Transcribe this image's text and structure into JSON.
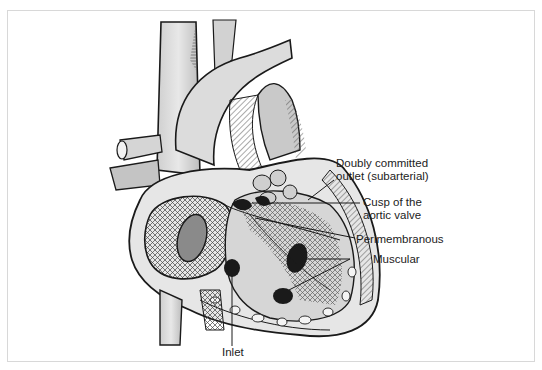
{
  "figure": {
    "colors": {
      "ink": "#1a1a1a",
      "shade_light": "#e4e4e4",
      "shade_mid": "#bdbdbd",
      "shade_dark": "#6a6a6a",
      "frame": "#d8d8d8"
    },
    "labels": [
      {
        "id": "doubly-committed",
        "line1": "Doubly committed",
        "line2": "outlet (subarterial)"
      },
      {
        "id": "cusp",
        "line1": "Cusp of the",
        "line2": "aortic valve"
      },
      {
        "id": "perimembranous",
        "line1": "Perimembranous"
      },
      {
        "id": "muscular",
        "line1": "Muscular"
      },
      {
        "id": "inlet",
        "line1": "Inlet"
      }
    ]
  }
}
